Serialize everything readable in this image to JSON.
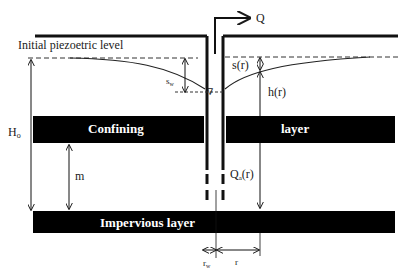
{
  "diagram": {
    "labels": {
      "initial_piezometric": "Initial piezoetric level",
      "discharge": "Q",
      "drawdown_well": "s",
      "drawdown_well_sub": "w",
      "drawdown_r": "s(r)",
      "head_r": "h(r)",
      "initial_head": "H",
      "initial_head_sub": "o",
      "confining_left": "Confining",
      "confining_right": "layer",
      "thickness": "m",
      "radial_flow": "Q",
      "radial_flow_sub": "a",
      "radial_flow_arg": "(r)",
      "impervious": "Impervious layer",
      "well_radius": "r",
      "well_radius_sub": "w",
      "radius": "r",
      "water_level_symbol": "∇"
    },
    "colors": {
      "layer_fill": "#000000",
      "line": "#1a1a1a",
      "background": "#ffffff"
    }
  }
}
